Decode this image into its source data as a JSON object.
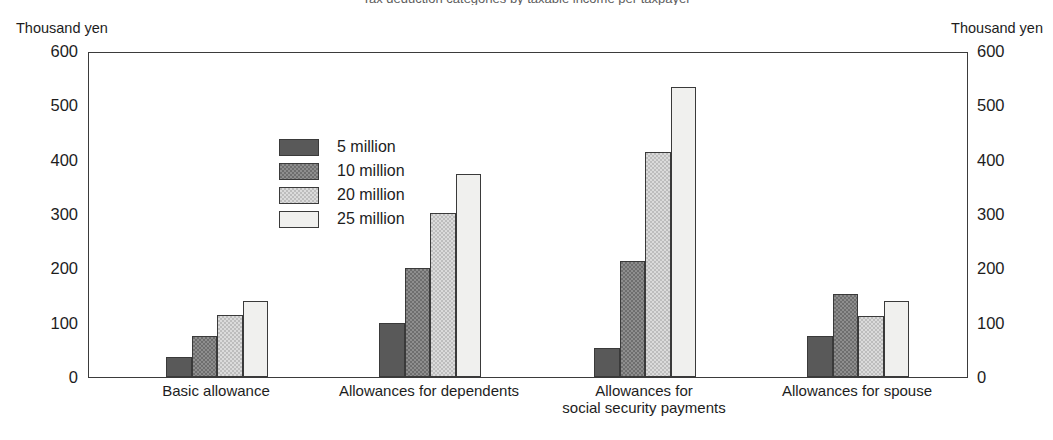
{
  "title_sliver": "Tax deduction categories by taxable income per taxpayer",
  "axis": {
    "left_unit": "Thousand yen",
    "right_unit": "Thousand yen",
    "ticks": [
      0,
      100,
      200,
      300,
      400,
      500,
      600
    ]
  },
  "legend": {
    "items": [
      {
        "label": "5 million",
        "swatch": "dark-gray-solid"
      },
      {
        "label": "10 million",
        "swatch": "medium-gray-hatch"
      },
      {
        "label": "20 million",
        "swatch": "light-gray-hatch"
      },
      {
        "label": "25 million",
        "swatch": "near-white"
      }
    ]
  },
  "colors": {
    "series": [
      "#595959",
      "#6e6e6e",
      "#bdbdbd",
      "#f0f0ee"
    ],
    "frame": "#3b3b3b",
    "text": "#1d1d1d",
    "background": "#ffffff"
  },
  "chart_data": {
    "type": "bar",
    "title": "",
    "xlabel": "",
    "ylabel": "Thousand yen",
    "ylim": [
      0,
      600
    ],
    "yticks": [
      0,
      100,
      200,
      300,
      400,
      500,
      600
    ],
    "grid": false,
    "legend_position": "inside upper-left",
    "categories": [
      "Basic allowance",
      "Allowances for dependents",
      "Allowances for\nsocial security payments",
      "Allowances for spouse"
    ],
    "series": [
      {
        "name": "5 million",
        "values": [
          37,
          100,
          54,
          75
        ]
      },
      {
        "name": "10 million",
        "values": [
          75,
          200,
          214,
          152
        ]
      },
      {
        "name": "20 million",
        "values": [
          114,
          301,
          414,
          113
        ]
      },
      {
        "name": "25 million",
        "values": [
          140,
          374,
          534,
          140
        ]
      }
    ]
  }
}
